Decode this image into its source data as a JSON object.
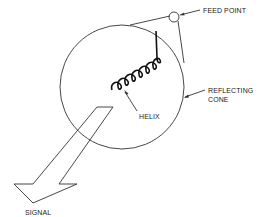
{
  "diagram": {
    "labels": {
      "feed_point": "FEED POINT",
      "reflecting_line1": "REFLECTING",
      "reflecting_line2": "CONE",
      "helix": "HELIX",
      "signal": "SIGNAL"
    },
    "colors": {
      "line": "#333333",
      "helix": "#111111",
      "background": "#ffffff"
    },
    "components": [
      "reflecting-cone",
      "feed-point",
      "helix",
      "signal-arrow"
    ]
  }
}
